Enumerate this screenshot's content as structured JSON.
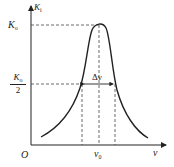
{
  "diagram": {
    "type": "resonance-curve",
    "y_axis_label": "K",
    "y_axis_label_sub": "i",
    "x_axis_label": "ν",
    "origin_label": "O",
    "peak_label": "K",
    "peak_label_sub": "o",
    "half_label_num": "K",
    "half_label_num_sub": "o",
    "half_label_den": "2",
    "center_label": "ν",
    "center_label_sub": "0",
    "width_label": "Δν",
    "colors": {
      "line": "#222222",
      "background": "#ffffff"
    }
  }
}
